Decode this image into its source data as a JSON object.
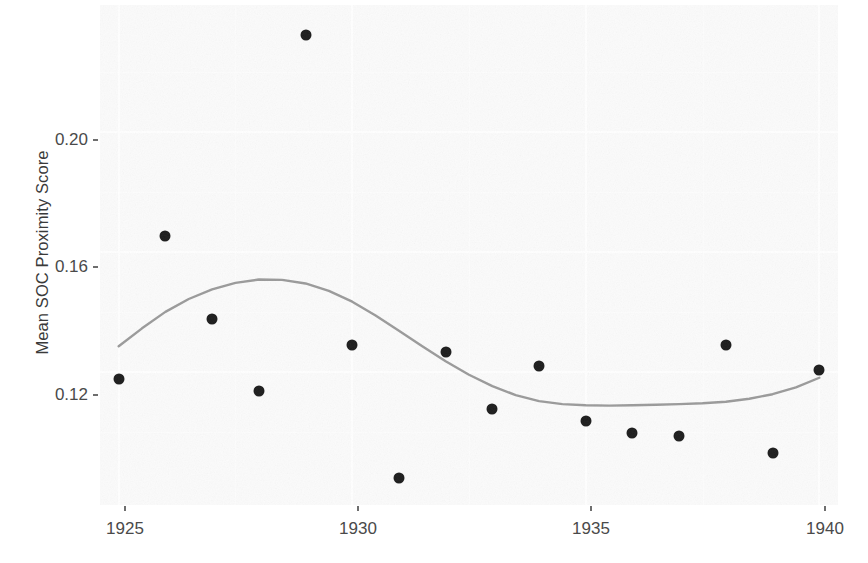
{
  "chart_data": {
    "type": "scatter",
    "title": "",
    "subtitle": "",
    "xlabel": "",
    "ylabel": "Mean SOC Proximity Score",
    "xlim": [
      1924.6,
      1940.4
    ],
    "ylim": [
      0.0755,
      0.2425
    ],
    "xticks": [
      1925,
      1930,
      1935,
      1940
    ],
    "xticklabels": [
      "1925",
      "1930",
      "1935",
      "1940"
    ],
    "yticks": [
      0.12,
      0.16,
      0.2
    ],
    "yticklabels": [
      "0.12",
      "0.16",
      "0.20"
    ],
    "grid": true,
    "legend": "none",
    "point_color": "#1b1b1b",
    "trend_color": "#9a9a9a",
    "panel_color": "#fbfbfb",
    "grid_color": "#ffffff",
    "x": [
      1925,
      1926,
      1927,
      1928,
      1929,
      1930,
      1931,
      1932,
      1933,
      1934,
      1935,
      1936,
      1937,
      1938,
      1939,
      1940
    ],
    "values": [
      0.1175,
      0.1655,
      0.1375,
      0.1135,
      0.2325,
      0.129,
      0.0845,
      0.1265,
      0.1075,
      0.122,
      0.1035,
      0.0995,
      0.0985,
      0.129,
      0.093,
      0.1205
    ],
    "series": [
      {
        "name": "Mean SOC Proximity Score",
        "values": [
          0.1175,
          0.1655,
          0.1375,
          0.1135,
          0.2325,
          0.129,
          0.0845,
          0.1265,
          0.1075,
          0.122,
          0.1035,
          0.0995,
          0.0985,
          0.129,
          0.093,
          0.1205
        ]
      },
      {
        "name": "LOESS smoothed trend",
        "type": "line",
        "x": [
          1925.0,
          1925.5,
          1926.0,
          1926.5,
          1927.0,
          1927.5,
          1928.0,
          1928.5,
          1929.0,
          1929.5,
          1930.0,
          1930.5,
          1931.0,
          1931.5,
          1932.0,
          1932.5,
          1933.0,
          1933.5,
          1934.0,
          1934.5,
          1935.0,
          1935.5,
          1936.0,
          1936.5,
          1937.0,
          1937.5,
          1938.0,
          1938.5,
          1939.0,
          1939.5,
          1940.0
        ],
        "values": [
          0.1285,
          0.1345,
          0.14,
          0.1443,
          0.1475,
          0.1497,
          0.1508,
          0.1507,
          0.1495,
          0.147,
          0.1434,
          0.1388,
          0.1337,
          0.1285,
          0.1235,
          0.119,
          0.1152,
          0.1122,
          0.1102,
          0.1092,
          0.1088,
          0.1087,
          0.1088,
          0.109,
          0.1092,
          0.1095,
          0.11,
          0.111,
          0.1125,
          0.1148,
          0.118
        ]
      }
    ]
  },
  "axis": {
    "ylabel": "Mean SOC Proximity Score",
    "ytick_0": "0.12",
    "ytick_1": "0.16",
    "ytick_2": "0.20",
    "xtick_0": "1925",
    "xtick_1": "1930",
    "xtick_2": "1935",
    "xtick_3": "1940"
  }
}
